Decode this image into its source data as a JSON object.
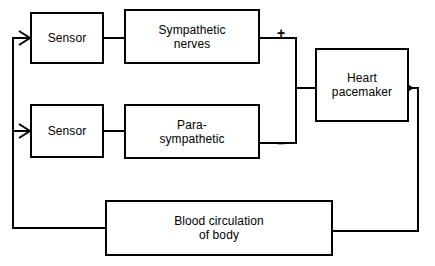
{
  "diagram": {
    "type": "block-diagram",
    "stroke_color": "#000000",
    "background_color": "#ffffff",
    "blocks": [
      {
        "id": "sensor-upper",
        "label": "Sensor"
      },
      {
        "id": "sympathetic-nerves",
        "label": "Sympathetic\nnerves"
      },
      {
        "id": "sensor-lower",
        "label": "Sensor"
      },
      {
        "id": "para-sympathetic",
        "label": "Para-\nsympathetic"
      },
      {
        "id": "heart-pacemaker",
        "label": "Heart\npacemaker"
      },
      {
        "id": "blood-circulation",
        "label": "Blood circulation\nof body"
      }
    ],
    "signs": [
      {
        "id": "plus",
        "label": "+"
      },
      {
        "id": "minus",
        "label": "–"
      }
    ]
  }
}
